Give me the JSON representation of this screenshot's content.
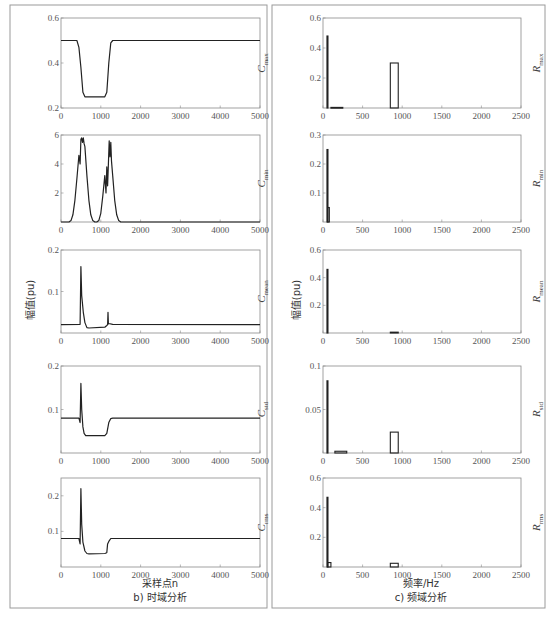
{
  "figure": {
    "left_panel": {
      "ylabel": "幅值(pu)",
      "xlabel": "采样点n",
      "caption": "b) 时域分析"
    },
    "right_panel": {
      "ylabel": "幅值(pu)",
      "xlabel": "频率/Hz",
      "caption": "c) 频域分析"
    }
  },
  "chart_data": [
    {
      "type": "line",
      "panel": "time",
      "name": "C_max",
      "side_label": "C",
      "side_sub": "max",
      "xlim": [
        0,
        5000
      ],
      "ylim": [
        0.2,
        0.6
      ],
      "xticks": [
        0,
        1000,
        2000,
        3000,
        4000,
        5000
      ],
      "yticks": [
        0.2,
        0.4,
        0.6
      ],
      "ytick_labels": [
        "0.2",
        "0.4",
        "0.6"
      ],
      "x": [
        0,
        400,
        450,
        500,
        550,
        600,
        1100,
        1150,
        1200,
        1250,
        1300,
        5000
      ],
      "y": [
        0.5,
        0.5,
        0.47,
        0.38,
        0.27,
        0.25,
        0.25,
        0.27,
        0.4,
        0.49,
        0.5,
        0.5
      ]
    },
    {
      "type": "line",
      "panel": "time",
      "name": "C_min",
      "side_label": "C",
      "side_sub": "min",
      "xlim": [
        0,
        5000
      ],
      "ylim": [
        0,
        6
      ],
      "xticks": [
        0,
        1000,
        2000,
        3000,
        4000,
        5000
      ],
      "yticks": [
        2,
        4,
        6
      ],
      "ytick_labels": [
        "2",
        "4",
        "6"
      ],
      "x": [
        0,
        200,
        250,
        300,
        350,
        400,
        450,
        480,
        500,
        520,
        540,
        560,
        580,
        600,
        650,
        700,
        750,
        800,
        850,
        900,
        950,
        1000,
        1050,
        1100,
        1130,
        1150,
        1170,
        1190,
        1210,
        1230,
        1250,
        1270,
        1300,
        1350,
        1400,
        1450,
        1500,
        5000
      ],
      "y": [
        0,
        0,
        0.1,
        0.5,
        1.5,
        3.0,
        4.6,
        4.0,
        5.7,
        5.8,
        5.5,
        5.8,
        5.4,
        5.2,
        3.2,
        1.5,
        0.5,
        0.1,
        0,
        0,
        0.1,
        0.6,
        1.8,
        3.2,
        2.0,
        3.8,
        2.5,
        4.0,
        5.6,
        4.5,
        5.5,
        4.2,
        3.2,
        1.5,
        0.5,
        0.1,
        0,
        0
      ]
    },
    {
      "type": "line",
      "panel": "time",
      "name": "C_mean",
      "side_label": "C",
      "side_sub": "mean",
      "xlim": [
        0,
        5000
      ],
      "ylim": [
        0,
        0.2
      ],
      "xticks": [
        0,
        1000,
        2000,
        3000,
        4000,
        5000
      ],
      "yticks": [
        0.1,
        0.2
      ],
      "ytick_labels": [
        "0.1",
        "0.2"
      ],
      "x": [
        0,
        480,
        500,
        520,
        560,
        600,
        650,
        700,
        1100,
        1150,
        1170,
        1180,
        1190,
        1200,
        1300,
        5000
      ],
      "y": [
        0.02,
        0.021,
        0.16,
        0.09,
        0.05,
        0.025,
        0.013,
        0.012,
        0.014,
        0.018,
        0.02,
        0.05,
        0.022,
        0.023,
        0.021,
        0.02
      ]
    },
    {
      "type": "line",
      "panel": "time",
      "name": "C_std",
      "side_label": "C",
      "side_sub": "std",
      "xlim": [
        0,
        5000
      ],
      "ylim": [
        0,
        0.2
      ],
      "xticks": [
        0,
        1000,
        2000,
        3000,
        4000,
        5000
      ],
      "yticks": [
        0.1,
        0.2
      ],
      "ytick_labels": [
        "0.1",
        "0.2"
      ],
      "x": [
        0,
        450,
        480,
        500,
        520,
        550,
        580,
        620,
        700,
        1100,
        1150,
        1200,
        1250,
        1300,
        5000
      ],
      "y": [
        0.08,
        0.08,
        0.07,
        0.16,
        0.1,
        0.06,
        0.045,
        0.04,
        0.04,
        0.04,
        0.045,
        0.07,
        0.079,
        0.08,
        0.08
      ]
    },
    {
      "type": "line",
      "panel": "time",
      "name": "C_rms",
      "side_label": "C",
      "side_sub": "rms",
      "xlim": [
        0,
        5000
      ],
      "ylim": [
        0,
        0.25
      ],
      "xticks": [
        0,
        1000,
        2000,
        3000,
        4000,
        5000
      ],
      "yticks": [
        0.1,
        0.2
      ],
      "ytick_labels": [
        "0.1",
        "0.2"
      ],
      "x": [
        0,
        450,
        480,
        500,
        520,
        550,
        600,
        650,
        700,
        1100,
        1150,
        1170,
        1200,
        1250,
        5000
      ],
      "y": [
        0.08,
        0.08,
        0.065,
        0.22,
        0.12,
        0.07,
        0.045,
        0.038,
        0.037,
        0.038,
        0.04,
        0.065,
        0.072,
        0.08,
        0.08
      ]
    },
    {
      "type": "bar",
      "panel": "freq",
      "name": "R_max",
      "side_label": "R",
      "side_sub": "max",
      "xlim": [
        0,
        2500
      ],
      "ylim": [
        0,
        0.6
      ],
      "xticks": [
        0,
        500,
        1000,
        1500,
        2000,
        2500
      ],
      "yticks": [
        0.2,
        0.4,
        0.6
      ],
      "ytick_labels": [
        "0.2",
        "0.4",
        "0.6"
      ],
      "bars": [
        {
          "x0": 50,
          "x1": 60,
          "value": 0.48
        },
        {
          "x0": 100,
          "x1": 250,
          "value": 0.004
        },
        {
          "x0": 850,
          "x1": 950,
          "value": 0.3
        }
      ]
    },
    {
      "type": "bar",
      "panel": "freq",
      "name": "R_min",
      "side_label": "R",
      "side_sub": "min",
      "xlim": [
        0,
        2500
      ],
      "ylim": [
        0,
        0.3
      ],
      "xticks": [
        0,
        500,
        1000,
        1500,
        2000,
        2500
      ],
      "yticks": [
        0.1,
        0.2,
        0.3
      ],
      "ytick_labels": [
        "0.1",
        "0.2",
        "0.3"
      ],
      "bars": [
        {
          "x0": 50,
          "x1": 60,
          "value": 0.25
        },
        {
          "x0": 60,
          "x1": 80,
          "value": 0.05
        }
      ]
    },
    {
      "type": "bar",
      "panel": "freq",
      "name": "R_mean",
      "side_label": "R",
      "side_sub": "mean",
      "xlim": [
        0,
        2500
      ],
      "ylim": [
        0,
        0.6
      ],
      "xticks": [
        0,
        500,
        1000,
        1500,
        2000,
        2500
      ],
      "yticks": [
        0.2,
        0.4,
        0.6
      ],
      "ytick_labels": [
        "0.2",
        "0.4",
        "0.6"
      ],
      "bars": [
        {
          "x0": 50,
          "x1": 60,
          "value": 0.46
        },
        {
          "x0": 850,
          "x1": 950,
          "value": 0.006
        }
      ]
    },
    {
      "type": "bar",
      "panel": "freq",
      "name": "R_std",
      "side_label": "R",
      "side_sub": "std",
      "xlim": [
        0,
        2500
      ],
      "ylim": [
        0,
        0.1
      ],
      "xticks": [
        0,
        500,
        1000,
        1500,
        2000,
        2500
      ],
      "yticks": [
        0.05,
        0.1
      ],
      "ytick_labels": [
        "0.05",
        "0.1"
      ],
      "bars": [
        {
          "x0": 50,
          "x1": 60,
          "value": 0.083
        },
        {
          "x0": 150,
          "x1": 300,
          "value": 0.002
        },
        {
          "x0": 850,
          "x1": 950,
          "value": 0.024
        }
      ]
    },
    {
      "type": "bar",
      "panel": "freq",
      "name": "R_rms",
      "side_label": "R",
      "side_sub": "rms",
      "xlim": [
        0,
        2500
      ],
      "ylim": [
        0,
        0.6
      ],
      "xticks": [
        0,
        500,
        1000,
        1500,
        2000,
        2500
      ],
      "yticks": [
        0.2,
        0.4,
        0.6
      ],
      "ytick_labels": [
        "0.2",
        "0.4",
        "0.6"
      ],
      "bars": [
        {
          "x0": 50,
          "x1": 60,
          "value": 0.47
        },
        {
          "x0": 60,
          "x1": 100,
          "value": 0.03
        },
        {
          "x0": 850,
          "x1": 950,
          "value": 0.025
        }
      ]
    }
  ]
}
